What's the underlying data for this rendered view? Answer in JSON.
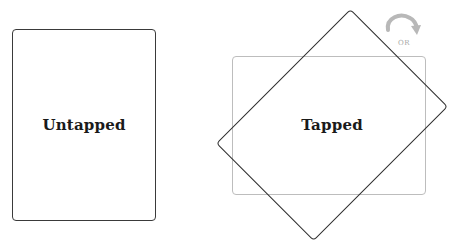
{
  "diagram": {
    "untapped_card": {
      "label": "Untapped",
      "rotation_deg": 0
    },
    "tapped_card": {
      "label": "Tapped",
      "rotation_deg": 45,
      "ghost_rotation_deg": 90
    },
    "rotation_hint": {
      "icon": "curved-arrow-clockwise-icon",
      "text": "OR"
    }
  },
  "colors": {
    "card_border": "#3a3a3a",
    "ghost_border": "#bdbdbd",
    "arrow": "#b5b5b5",
    "label_text": "#1a1a1a"
  }
}
